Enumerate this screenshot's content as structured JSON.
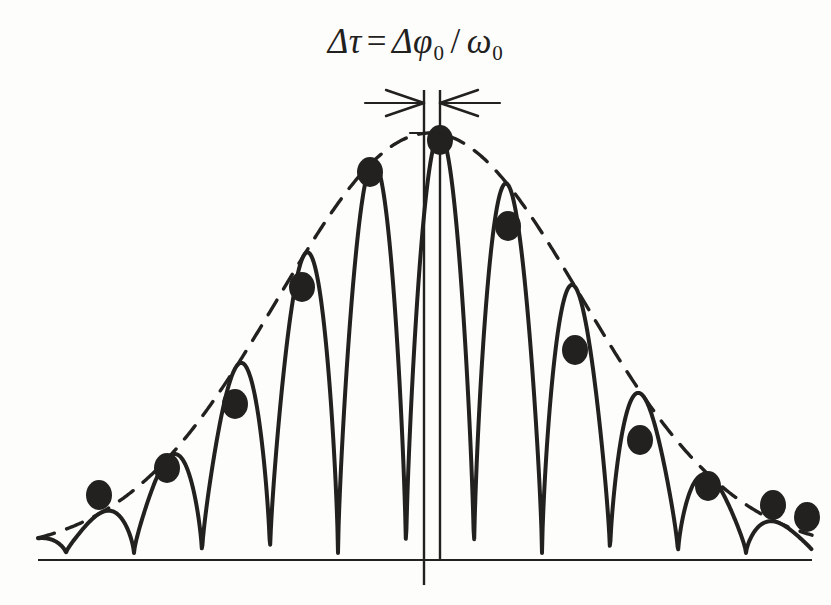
{
  "figure": {
    "background_color": "#fdfdfc",
    "ink_color": "#222120",
    "annotation": {
      "formula_plain": "Δτ = Δφ₀ / ω₀",
      "delta_1": "Δ",
      "tau": "τ",
      "equals": "=",
      "delta_2": "Δ",
      "phi": "φ",
      "phi_subscript": "0",
      "slash": "/",
      "omega": "ω",
      "omega_subscript": "0"
    },
    "dimension_marker": {
      "name": "delta-tau-dimension-arrows",
      "line_y": 103,
      "left_end_x": 365,
      "right_end_x": 500,
      "left_arrow_tip_x": 424,
      "right_arrow_tip_x": 440,
      "arrow_half_height": 13,
      "arrow_length": 38
    },
    "axis_lines": [
      {
        "name": "vertical-reference-axis",
        "x": 424,
        "y_top": 90,
        "y_bottom": 585,
        "width": 2.4
      },
      {
        "name": "vertical-peak-marker-axis",
        "x": 440,
        "y_top": 90,
        "y_bottom": 561,
        "width": 2.4
      },
      {
        "name": "horizontal-baseline",
        "y": 560,
        "x_left": 38,
        "x_right": 812,
        "width": 2.2
      }
    ],
    "envelope": {
      "name": "gaussian-envelope",
      "style": "dashed",
      "dash_pattern": "17 13",
      "width": 3.4,
      "peak_x": 430,
      "peak_y": 133,
      "sigma": 152
    },
    "carrier": {
      "name": "rectified-oscillation-curve",
      "style": "solid",
      "width": 4.0,
      "baseline_y": 553,
      "period": 68,
      "phase_x": 440
    }
  },
  "chart_data": {
    "type": "line",
    "xlabel": "",
    "ylabel": "",
    "grid": false,
    "legend": null,
    "axis_baseline_y_px": 560,
    "xlim_px": [
      38,
      812
    ],
    "ylim_px": [
      560,
      90
    ],
    "envelope_series": {
      "name": "Gaussian envelope (dashed)",
      "type": "dashed-curve",
      "peak_x_px": 430,
      "peak_y_px": 133,
      "sigma_px": 152
    },
    "peak_markers": {
      "name": "Carrier peak samples (filled dots)",
      "marker": "filled-ellipse",
      "marker_width_px": 26,
      "marker_height_px": 30,
      "count": 12,
      "x_px": [
        99,
        167,
        235,
        302,
        370,
        440,
        508,
        575,
        640,
        708,
        773,
        807
      ],
      "y_px": [
        495,
        468,
        404,
        287,
        172,
        140,
        226,
        350,
        440,
        486,
        505,
        517
      ],
      "amplitudes_normalized": [
        0.16,
        0.22,
        0.37,
        0.65,
        0.92,
        1.0,
        0.79,
        0.5,
        0.29,
        0.18,
        0.13,
        0.1
      ]
    },
    "carrier_series": {
      "name": "Rectified carrier (solid)",
      "type": "abs-sine-modulated",
      "period_px": 68,
      "trough_y_px": 553,
      "phase_peak_x_px": 440
    },
    "annotations": [
      {
        "text": "Δτ = Δφ₀ / ω₀",
        "x_px": 430,
        "y_px": 40,
        "role": "title-formula"
      },
      {
        "text": "",
        "role": "dimension-arrow-pair",
        "x_from_px": 424,
        "x_to_px": 440,
        "y_px": 103
      }
    ]
  }
}
